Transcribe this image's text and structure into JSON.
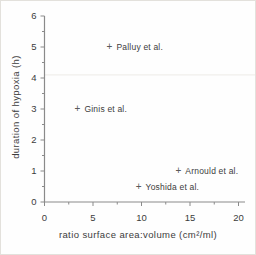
{
  "chart_data": {
    "type": "scatter",
    "title": "",
    "xlabel": "ratio surface area:volume (cm²/ml)",
    "ylabel": "duration of hypoxia (h)",
    "xlim": [
      0,
      20
    ],
    "ylim": [
      0,
      6
    ],
    "x_tick_values": [
      0,
      5,
      10,
      15,
      20
    ],
    "x_tick_labels": [
      "0",
      "5",
      "10",
      "15",
      "20"
    ],
    "x_minor_step": 2.5,
    "y_tick_values": [
      0,
      1,
      2,
      3,
      4,
      5,
      6
    ],
    "y_tick_labels": [
      "0",
      "1",
      "2",
      "3",
      "4",
      "5",
      "6"
    ],
    "y_minor_step": 0.5,
    "marker_glyph": "+",
    "legend_position": "none",
    "grid": false,
    "points": [
      {
        "label": "Palluy et al.",
        "x": 6.7,
        "y": 5.0
      },
      {
        "label": "Ginis et al.",
        "x": 3.4,
        "y": 3.0
      },
      {
        "label": "Arnould et al.",
        "x": 13.8,
        "y": 1.0
      },
      {
        "label": "Yoshida et al.",
        "x": 9.7,
        "y": 0.5
      }
    ],
    "scan_artifact_line_y": 4.1,
    "colors": {
      "background": "#fefefe",
      "border": "#e3e1dc",
      "axis": "#8a8a8a",
      "tick_text": "#3c3c3c",
      "marker": "#5a5a5a",
      "point_label_text": "#3c3c3c",
      "artifact_line": "#edebe7"
    }
  }
}
